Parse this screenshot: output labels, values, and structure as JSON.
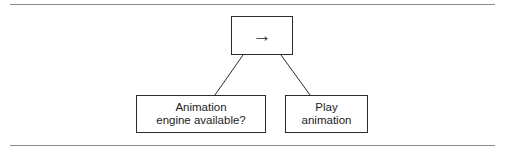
{
  "figure": {
    "background_color": "#ffffff",
    "stroke_color": "#2b2b2b",
    "rule_color": "#8a8a8a",
    "text_color": "#1c1c1c"
  },
  "rules": {
    "top_label": "top-horizontal-rule",
    "bottom_label": "bottom-horizontal-rule"
  },
  "nodes": {
    "root": {
      "icon": "right-arrow-icon",
      "glyph": "→"
    },
    "left": {
      "label": "Animation\nengine available?"
    },
    "right": {
      "label": "Play\nanimation"
    }
  },
  "edges": [
    {
      "name": "edge-root-to-left",
      "from": "root",
      "to": "left"
    },
    {
      "name": "edge-root-to-right",
      "from": "root",
      "to": "right"
    }
  ]
}
